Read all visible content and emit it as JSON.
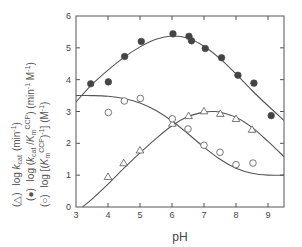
{
  "chart_data": {
    "type": "scatter",
    "title": "",
    "xlabel": "pH",
    "ylabel_lines": [
      {
        "symbol": "(△)",
        "text": "log k_cat (min⁻¹)"
      },
      {
        "symbol": "(●)",
        "text": "log (k_cat / K_m^CCP) (min⁻¹ M⁻¹)"
      },
      {
        "symbol": "(○)",
        "text": "log [(K_m^CCP)⁻¹] (M⁻¹)"
      }
    ],
    "xlim": [
      3,
      9.5
    ],
    "ylim": [
      0,
      6
    ],
    "xticks": [
      3,
      4,
      5,
      6,
      7,
      8,
      9
    ],
    "yticks": [
      0,
      1,
      2,
      3,
      4,
      5,
      6
    ],
    "grid": false,
    "legend_position": "y-axis label",
    "series": [
      {
        "name": "log (kcat/KmCCP) (min-1 M-1)",
        "marker": "filled-circle",
        "points": [
          [
            3.46,
            3.87
          ],
          [
            4.01,
            3.93
          ],
          [
            4.52,
            4.73
          ],
          [
            5.04,
            5.2
          ],
          [
            6.03,
            5.44
          ],
          [
            6.53,
            5.36
          ],
          [
            6.61,
            5.22
          ],
          [
            7.04,
            4.98
          ],
          [
            7.55,
            4.69
          ],
          [
            8.06,
            4.14
          ],
          [
            8.56,
            3.89
          ],
          [
            9.1,
            2.87
          ]
        ],
        "fit_curve": [
          [
            3.0,
            3.3
          ],
          [
            3.5,
            3.85
          ],
          [
            4.0,
            4.3
          ],
          [
            4.5,
            4.7
          ],
          [
            5.0,
            5.03
          ],
          [
            5.5,
            5.27
          ],
          [
            6.0,
            5.37
          ],
          [
            6.5,
            5.3
          ],
          [
            7.0,
            5.05
          ],
          [
            7.5,
            4.66
          ],
          [
            8.0,
            4.18
          ],
          [
            8.5,
            3.66
          ],
          [
            9.0,
            3.18
          ],
          [
            9.5,
            2.72
          ]
        ]
      },
      {
        "name": "log kcat (min-1)",
        "marker": "open-triangle",
        "points": [
          [
            4.0,
            0.95
          ],
          [
            4.49,
            1.38
          ],
          [
            5.0,
            1.78
          ],
          [
            6.01,
            2.62
          ],
          [
            6.52,
            2.86
          ],
          [
            7.0,
            3.01
          ],
          [
            7.51,
            2.93
          ],
          [
            8.0,
            2.77
          ],
          [
            8.5,
            2.43
          ]
        ],
        "fit_curve": [
          [
            3.2,
            0.0
          ],
          [
            3.5,
            0.25
          ],
          [
            4.0,
            0.72
          ],
          [
            4.5,
            1.22
          ],
          [
            5.0,
            1.7
          ],
          [
            5.5,
            2.15
          ],
          [
            6.0,
            2.55
          ],
          [
            6.5,
            2.84
          ],
          [
            7.0,
            2.98
          ],
          [
            7.3,
            3.0
          ],
          [
            7.5,
            2.98
          ],
          [
            8.0,
            2.82
          ],
          [
            8.5,
            2.5
          ],
          [
            9.0,
            2.06
          ],
          [
            9.5,
            1.58
          ]
        ]
      },
      {
        "name": "log [(KmCCP)-1] (M-1)",
        "marker": "open-circle",
        "points": [
          [
            4.01,
            2.97
          ],
          [
            4.51,
            3.33
          ],
          [
            5.01,
            3.41
          ],
          [
            6.01,
            2.77
          ],
          [
            6.5,
            2.45
          ],
          [
            7.0,
            1.94
          ],
          [
            7.5,
            1.72
          ],
          [
            8.0,
            1.33
          ],
          [
            8.53,
            1.38
          ]
        ],
        "fit_curve": [
          [
            3.0,
            3.5
          ],
          [
            3.5,
            3.5
          ],
          [
            4.0,
            3.48
          ],
          [
            4.5,
            3.41
          ],
          [
            5.0,
            3.27
          ],
          [
            5.5,
            3.03
          ],
          [
            6.0,
            2.7
          ],
          [
            6.5,
            2.3
          ],
          [
            7.0,
            1.88
          ],
          [
            7.5,
            1.5
          ],
          [
            8.0,
            1.22
          ],
          [
            8.5,
            1.06
          ],
          [
            9.0,
            1.0
          ],
          [
            9.5,
            1.0
          ]
        ]
      }
    ]
  },
  "legend": {
    "triangle_symbol": "(△)",
    "filled_symbol": "(●)",
    "open_symbol": "(○)"
  }
}
